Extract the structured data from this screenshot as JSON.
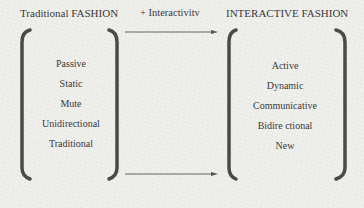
{
  "left_panel": {
    "title": "Traditional FASHION",
    "items": [
      "Passive",
      "Static",
      "Mute",
      "Unidirectional",
      "Traditional"
    ]
  },
  "transition": {
    "label": "+ Interactivitv",
    "arrow_count": 2
  },
  "right_panel": {
    "title": "INTERACTIVE FASHION",
    "items": [
      "Active",
      "Dynamic",
      "Communicative",
      "Bidire ctional",
      "New"
    ]
  },
  "colors": {
    "background": "#efefec",
    "text": "#3a3a3a",
    "bracket": "#4a4a4a",
    "arrow": "#555555"
  }
}
